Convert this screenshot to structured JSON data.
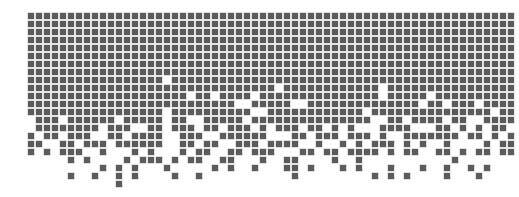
{
  "figure": {
    "square_color": "#5b5b5b",
    "background_color": "#ffffff",
    "columns": 61,
    "rows": 22,
    "cell_size_px": 6,
    "pitch_px": 8,
    "filled": {
      "0": "all",
      "1": "all",
      "2": "all",
      "3": "all",
      "4": "all",
      "5": "all",
      "6": "all",
      "7": "all",
      "8": {
        "except": [
          17
        ]
      },
      "9": {
        "except": [
          31,
          44
        ]
      },
      "10": {
        "except": [
          20,
          23,
          28,
          44,
          50
        ]
      },
      "11": {
        "except": [
          26,
          27,
          33,
          34,
          49,
          52,
          56
        ]
      },
      "12": {
        "except": [
          17,
          28,
          29,
          42,
          58
        ]
      },
      "13": [
        1,
        2,
        3,
        5,
        6,
        7,
        8,
        9,
        10,
        12,
        13,
        14,
        15,
        16,
        18,
        19,
        22,
        23,
        24,
        25,
        26,
        28,
        29,
        30,
        31,
        32,
        33,
        34,
        35,
        36,
        37,
        38,
        39,
        40,
        41,
        42,
        45,
        46,
        48,
        49,
        50,
        51,
        53,
        54,
        57,
        58,
        59,
        60
      ],
      "14": [
        1,
        2,
        3,
        4,
        5,
        6,
        7,
        8,
        10,
        11,
        12,
        15,
        16,
        18,
        19,
        20,
        22,
        23,
        25,
        26,
        27,
        29,
        31,
        32,
        33,
        35,
        36,
        38,
        40,
        44,
        45,
        46,
        47,
        51,
        52,
        54,
        56,
        58,
        59
      ],
      "15": [
        0,
        2,
        3,
        5,
        6,
        7,
        10,
        11,
        13,
        14,
        15,
        16,
        19,
        20,
        21,
        24,
        25,
        26,
        27,
        28,
        29,
        33,
        34,
        36,
        37,
        38,
        40,
        41,
        42,
        44,
        47,
        48,
        49,
        50,
        51,
        52,
        53,
        55,
        56,
        58,
        60
      ],
      "16": [
        0,
        1,
        4,
        5,
        7,
        8,
        9,
        11,
        12,
        13,
        14,
        15,
        16,
        19,
        20,
        22,
        23,
        26,
        27,
        28,
        30,
        31,
        32,
        33,
        36,
        39,
        41,
        43,
        44,
        45,
        47,
        49,
        52,
        57,
        59,
        60
      ],
      "17": [
        0,
        2,
        4,
        5,
        6,
        9,
        13,
        15,
        19,
        21,
        22,
        25,
        26,
        28,
        29,
        30,
        34,
        35,
        37,
        38,
        40,
        41,
        42,
        43,
        45,
        47,
        48,
        51,
        52,
        54,
        56,
        57,
        59,
        60
      ],
      "18": [
        5,
        7,
        12,
        14,
        15,
        16,
        18,
        20,
        21,
        24,
        25,
        29,
        32,
        33,
        38,
        41,
        53
      ],
      "19": [
        9,
        11,
        13,
        17,
        23,
        25,
        28,
        32,
        33,
        35,
        39,
        41,
        45,
        49,
        52,
        55,
        57
      ],
      "20": [
        5,
        8,
        11,
        13,
        18,
        21,
        33,
        43,
        45,
        47,
        52,
        56
      ],
      "21": [
        11
      ]
    }
  }
}
